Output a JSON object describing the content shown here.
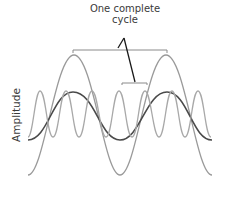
{
  "annotation": {
    "line1": "One complete",
    "line2": "cycle"
  },
  "axis": {
    "ylabel": "Amplitude"
  },
  "waves": [
    {
      "name": "large-slow-wave",
      "color": "#9a9a9a",
      "description": "high amplitude, long wavelength"
    },
    {
      "name": "medium-wave",
      "color": "#4a4a4a",
      "description": "medium amplitude, long wavelength"
    },
    {
      "name": "fast-wave",
      "color": "#a8a8a8",
      "description": "low amplitude, short wavelength"
    }
  ],
  "brackets": [
    {
      "name": "large-cycle-bracket",
      "label": "One complete cycle"
    },
    {
      "name": "small-cycle-bracket",
      "label": "One complete cycle"
    }
  ]
}
